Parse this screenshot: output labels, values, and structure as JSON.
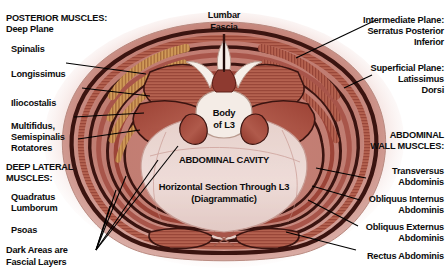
{
  "figure": {
    "background_color": "#ffffff",
    "palette": {
      "halo": "#f3dcda",
      "skin_outer": "#d9a89f",
      "muscle_mid": "#a84f43",
      "muscle_deep": "#8e3a30",
      "muscle_light": "#c0776a",
      "fascia_dark": "#3b1410",
      "striation_tan": "#c98a4e",
      "striation_gold": "#d9a05c",
      "cavity": "#ead6d2",
      "bone_white": "#f6efe9",
      "leader_line": "#000000",
      "text": "#0d0d0d"
    }
  },
  "labels": {
    "top_left": {
      "header": [
        "POSTERIOR MUSCLES:",
        "Deep Plane"
      ],
      "items": [
        {
          "name": "spinalis",
          "text": [
            "Spinalis"
          ]
        },
        {
          "name": "longissimus",
          "text": [
            "Longissimus"
          ]
        },
        {
          "name": "iliocostalis",
          "text": [
            "Iliocostalis"
          ]
        },
        {
          "name": "multifidus",
          "text": [
            "Multifidus,",
            "Semispinalis",
            "Rotatores"
          ]
        }
      ]
    },
    "bottom_left": {
      "header": [
        "DEEP LATERAL",
        "MUSCLES:"
      ],
      "items": [
        {
          "name": "quadratus-lumborum",
          "text": [
            "Quadratus",
            "Lumborum"
          ]
        },
        {
          "name": "psoas",
          "text": [
            "Psoas"
          ]
        },
        {
          "name": "fascial-layers-note",
          "text": [
            "Dark Areas are",
            "Fascial Layers"
          ]
        }
      ]
    },
    "top_right": {
      "items": [
        {
          "name": "intermediate-plane",
          "text": [
            "Intermediate Plane:",
            "Serratus Posterior",
            "Inferior"
          ]
        },
        {
          "name": "superficial-plane",
          "text": [
            "Superficial Plane:",
            "Latissimus",
            "Dorsi"
          ]
        }
      ]
    },
    "bottom_right": {
      "header": [
        "ABDOMINAL",
        "WALL MUSCLES:"
      ],
      "items": [
        {
          "name": "transversus-abdominis",
          "text": [
            "Transversus",
            "Abdominis"
          ]
        },
        {
          "name": "obliquus-internus",
          "text": [
            "Obliquus Internus",
            "Abdominis"
          ]
        },
        {
          "name": "obliquus-externus",
          "text": [
            "Obliquus Externus",
            "Abdominis"
          ]
        },
        {
          "name": "rectus-abdominis",
          "text": [
            "Rectus Abdominis"
          ]
        }
      ]
    },
    "top_center": {
      "name": "lumbar-fascia",
      "text": [
        "Lumbar",
        "Fascia"
      ]
    },
    "center": {
      "vertebral_body": [
        "Body",
        "of L3"
      ],
      "cavity": "ABDOMINAL CAVITY",
      "caption": [
        "Horizontal Section Through L3",
        "(Diagrammatic)"
      ]
    }
  }
}
